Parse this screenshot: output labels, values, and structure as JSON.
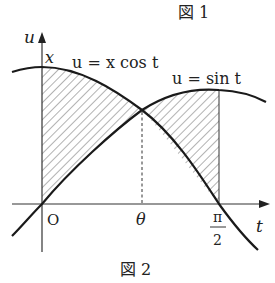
{
  "figure_captions": {
    "top": "図 1",
    "bottom": "図 2"
  },
  "axes": {
    "vertical_label": "u",
    "horizontal_label": "t",
    "origin_label": "O"
  },
  "curves": {
    "cos_curve_label": "u = x cos t",
    "sin_curve_label": "u = sin t"
  },
  "point_labels": {
    "y_intercept": "x",
    "intersection_t": "θ",
    "pi_numerator": "π",
    "pi_denominator": "2"
  },
  "colors": {
    "line": "#1a1a1a",
    "hatch": "#555555",
    "text": "#222222"
  }
}
